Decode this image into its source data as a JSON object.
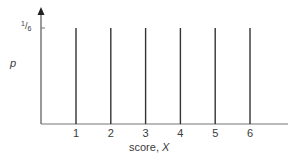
{
  "chart_data": {
    "type": "bar",
    "subtype": "spike",
    "title": "",
    "categories": [
      "1",
      "2",
      "3",
      "4",
      "5",
      "6"
    ],
    "x": [
      1,
      2,
      3,
      4,
      5,
      6
    ],
    "values": [
      0.1667,
      0.1667,
      0.1667,
      0.1667,
      0.1667,
      0.1667
    ],
    "xlabel": "score, X",
    "ylabel": "p",
    "yticks": [
      {
        "value": 0.1667,
        "label": "1/6"
      }
    ],
    "ylim": [
      0,
      0.2
    ],
    "xlim": [
      0,
      7
    ],
    "grid": false,
    "legend": null
  },
  "axes": {
    "ylabel": "p",
    "xlabel_text": "score, ",
    "xlabel_var": "X",
    "ytick_num": "1",
    "ytick_den": "6"
  },
  "colors": {
    "axis": "#777777",
    "spike": "#333333",
    "text": "#3a3a3a"
  }
}
